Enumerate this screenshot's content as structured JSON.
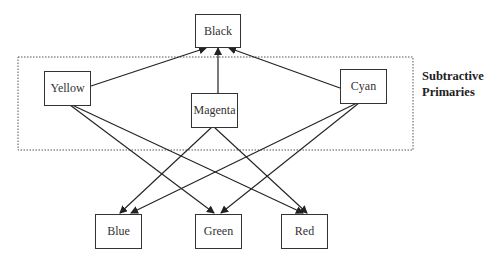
{
  "diagram": {
    "type": "directed-graph",
    "group": {
      "label_line1": "Subtractive",
      "label_line2": "Primaries",
      "members": [
        "Yellow",
        "Magenta",
        "Cyan"
      ]
    },
    "nodes": {
      "black": "Black",
      "yellow": "Yellow",
      "magenta": "Magenta",
      "cyan": "Cyan",
      "blue": "Blue",
      "green": "Green",
      "red": "Red"
    },
    "edges": [
      {
        "from": "Yellow",
        "to": "Black"
      },
      {
        "from": "Magenta",
        "to": "Black"
      },
      {
        "from": "Cyan",
        "to": "Black"
      },
      {
        "from": "Yellow",
        "to": "Green"
      },
      {
        "from": "Yellow",
        "to": "Red"
      },
      {
        "from": "Magenta",
        "to": "Blue"
      },
      {
        "from": "Magenta",
        "to": "Red"
      },
      {
        "from": "Cyan",
        "to": "Blue"
      },
      {
        "from": "Cyan",
        "to": "Green"
      }
    ],
    "colors": {
      "stroke": "#333333",
      "background": "#ffffff"
    }
  }
}
